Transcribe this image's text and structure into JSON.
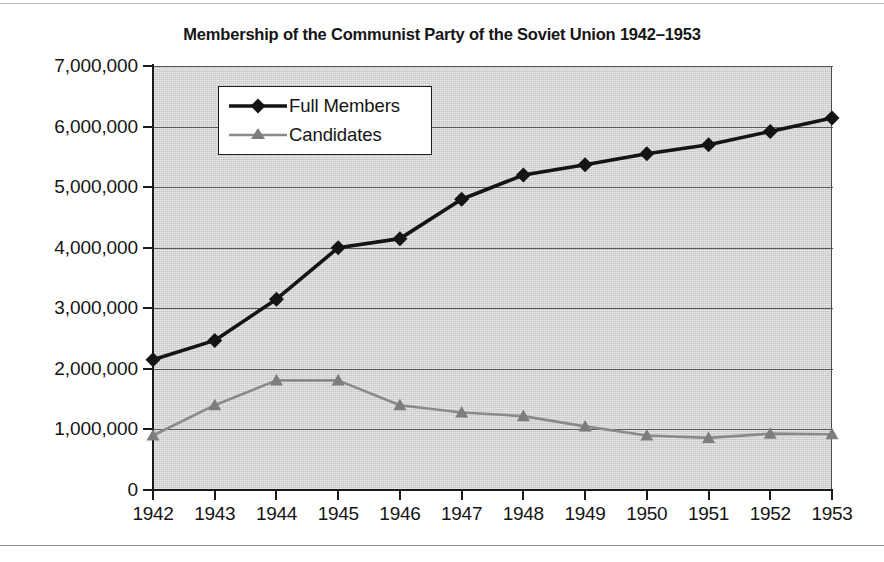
{
  "chart_data": {
    "type": "line",
    "title": "Membership of the Communist Party of the Soviet Union 1942–1953",
    "xlabel": "",
    "ylabel": "",
    "categories": [
      "1942",
      "1943",
      "1944",
      "1945",
      "1946",
      "1947",
      "1948",
      "1949",
      "1950",
      "1951",
      "1952",
      "1953"
    ],
    "x": [
      1942,
      1943,
      1944,
      1945,
      1946,
      1947,
      1948,
      1949,
      1950,
      1951,
      1952,
      1953
    ],
    "series": [
      {
        "name": "Full Members",
        "color": "#141414",
        "marker": "diamond",
        "values": [
          2150000,
          2470000,
          3150000,
          4000000,
          4150000,
          4800000,
          5200000,
          5370000,
          5550000,
          5700000,
          5920000,
          6140000
        ]
      },
      {
        "name": "Candidates",
        "color": "#7d7d7d",
        "marker": "triangle",
        "values": [
          900000,
          1400000,
          1810000,
          1810000,
          1400000,
          1280000,
          1220000,
          1050000,
          900000,
          860000,
          930000,
          920000
        ]
      }
    ],
    "ylim": [
      0,
      7000000
    ],
    "yticks": [
      0,
      1000000,
      2000000,
      3000000,
      4000000,
      5000000,
      6000000,
      7000000
    ],
    "ytick_labels": [
      "0",
      "1,000,000",
      "2,000,000",
      "3,000,000",
      "4,000,000",
      "5,000,000",
      "6,000,000",
      "7,000,000"
    ],
    "grid": true,
    "legend_position": "top-left",
    "plot_background": "#d2d2d2",
    "page_background": "#ffffff"
  },
  "legend": {
    "entries": [
      {
        "label": "Full Members"
      },
      {
        "label": "Candidates"
      }
    ]
  }
}
